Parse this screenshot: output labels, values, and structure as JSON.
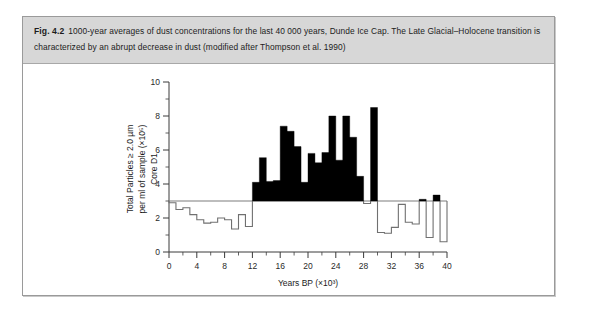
{
  "figure": {
    "label": "Fig. 4.2",
    "caption": "1000-year averages of dust concentrations for the last 40 000 years, Dunde Ice Cap. The Late Glacial–Holocene transition is characterized by an abrupt decrease in dust (modified after Thompson et al. 1990)"
  },
  "colors": {
    "caption_background": "#d7d7d7",
    "figure_border": "#9a9a9a",
    "page_background": "#ffffff",
    "bar_fill": "#000000",
    "open_step_stroke": "#707070",
    "reference_line": "#7d7d7d",
    "axis": "#3a3a3a"
  },
  "chart_data": {
    "type": "bar",
    "title": "",
    "subtitle": "",
    "xlabel": "Years BP (×10³)",
    "ylabel": "Total Particles ≥ 2.0 µm per ml of sample (×10⁵) Core D1",
    "ylabel_lines": [
      "Total Particles ≥ 2.0 µm",
      "per ml of sample (×10⁵)",
      "Core D1"
    ],
    "xlim": [
      0,
      40
    ],
    "ylim": [
      0,
      10
    ],
    "x_ticks_major": [
      0,
      4,
      8,
      12,
      16,
      20,
      24,
      28,
      32,
      36,
      40
    ],
    "x_ticks_minor": [
      2,
      6,
      10,
      14,
      18,
      22,
      26,
      30,
      34,
      38
    ],
    "y_ticks_major": [
      0,
      2,
      4,
      6,
      8,
      10
    ],
    "y_ticks_minor": [
      1,
      3,
      5,
      7,
      9
    ],
    "grid": false,
    "legend": null,
    "bin_width": 1,
    "reference_line_y": 3.0,
    "reference_line_note": "horizontal baseline at 3 ×10⁵ particles per ml",
    "categories": [
      "0-1",
      "1-2",
      "2-3",
      "3-4",
      "4-5",
      "5-6",
      "6-7",
      "7-8",
      "8-9",
      "9-10",
      "10-11",
      "11-12",
      "12-13",
      "13-14",
      "14-15",
      "15-16",
      "16-17",
      "17-18",
      "18-19",
      "19-20",
      "20-21",
      "21-22",
      "22-23",
      "23-24",
      "24-25",
      "25-26",
      "26-27",
      "27-28",
      "28-29",
      "29-30",
      "30-31",
      "31-32",
      "32-33",
      "33-34",
      "34-35",
      "35-36",
      "36-37",
      "37-38",
      "38-39",
      "39-40"
    ],
    "values": [
      2.9,
      2.5,
      2.6,
      2.2,
      1.9,
      1.7,
      1.75,
      2.0,
      1.9,
      1.35,
      2.2,
      1.5,
      4.1,
      5.55,
      4.15,
      4.2,
      7.4,
      7.1,
      6.2,
      4.1,
      5.8,
      5.25,
      5.85,
      8.0,
      5.4,
      8.0,
      6.75,
      4.45,
      2.85,
      8.5,
      1.15,
      1.1,
      1.45,
      2.8,
      1.75,
      1.65,
      3.1,
      0.85,
      3.35,
      0.6
    ],
    "series": [
      {
        "name": "Dust concentration (1000-year average)",
        "values": [
          2.9,
          2.5,
          2.6,
          2.2,
          1.9,
          1.7,
          1.75,
          2.0,
          1.9,
          1.35,
          2.2,
          1.5,
          4.1,
          5.55,
          4.15,
          4.2,
          7.4,
          7.1,
          6.2,
          4.1,
          5.8,
          5.25,
          5.85,
          8.0,
          5.4,
          8.0,
          6.75,
          4.45,
          2.85,
          8.5,
          1.15,
          1.1,
          1.45,
          2.8,
          1.75,
          1.65,
          3.1,
          0.85,
          3.35,
          0.6
        ]
      }
    ],
    "style_note": "Bins above the 3×10⁵ reference line are drawn as solid black fill down to the line; bins below are drawn as an open (unfilled) stepped outline."
  }
}
